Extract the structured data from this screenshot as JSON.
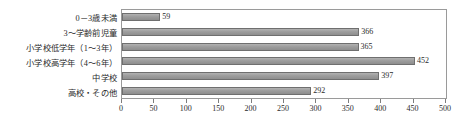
{
  "chart_data": {
    "type": "bar",
    "orientation": "horizontal",
    "title": "",
    "subtitle": "",
    "xlabel": "",
    "ylabel": "",
    "xlim": [
      0,
      500
    ],
    "xticks": [
      0,
      50,
      100,
      150,
      200,
      250,
      300,
      350,
      400,
      450,
      500
    ],
    "grid": false,
    "legend": false,
    "show_value_labels": true,
    "bar_color": "#9d9d9d",
    "bar_border_color": "#6f6f6f",
    "plot_border_color": "#9a9a9a",
    "text_color": "#2b2b2b",
    "categories": [
      "0－3歳未満",
      "3～学齢前児童",
      "小学校低学年（1～3年）",
      "小学校高学年（4～6年）",
      "中学校",
      "高校・その他"
    ],
    "values": [
      59,
      366,
      365,
      452,
      397,
      292
    ],
    "value_labels": [
      "59",
      "366",
      "365",
      "452",
      "397",
      "292"
    ]
  }
}
